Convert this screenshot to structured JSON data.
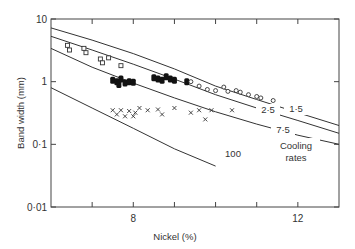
{
  "chart_data": {
    "type": "scatter",
    "title": "",
    "xlabel": "Nickel (%)",
    "ylabel": "Band width (mm)",
    "xlim": [
      6,
      13
    ],
    "ylim": [
      0.01,
      10
    ],
    "yscale": "log",
    "x_ticks": [
      7,
      8,
      9,
      10,
      11,
      12
    ],
    "x_tick_labels": [
      "8",
      "12"
    ],
    "y_tick_labels": [
      "10",
      "1",
      "0·1",
      "0·01"
    ],
    "grid": false,
    "legend": null,
    "annotations": [
      "1·5",
      "2·5",
      "7·5",
      "100",
      "Cooling",
      "rates"
    ],
    "curves": [
      {
        "name": "1·5",
        "points": [
          [
            6,
            7.2
          ],
          [
            7,
            4.6
          ],
          [
            8,
            2.8
          ],
          [
            9,
            1.6
          ],
          [
            10,
            0.85
          ],
          [
            11,
            0.52
          ],
          [
            12,
            0.32
          ],
          [
            13,
            0.2
          ]
        ]
      },
      {
        "name": "2·5",
        "points": [
          [
            6,
            5.3
          ],
          [
            7,
            3.2
          ],
          [
            8,
            1.9
          ],
          [
            9,
            1.1
          ],
          [
            10,
            0.62
          ],
          [
            11,
            0.38
          ],
          [
            12,
            0.24
          ],
          [
            13,
            0.15
          ]
        ]
      },
      {
        "name": "7·5",
        "points": [
          [
            6,
            3.4
          ],
          [
            7,
            1.7
          ],
          [
            8,
            0.95
          ],
          [
            9,
            0.55
          ],
          [
            10,
            0.33
          ],
          [
            11,
            0.21
          ],
          [
            12,
            0.14
          ],
          [
            13,
            0.1
          ]
        ]
      },
      {
        "name": "100",
        "points": [
          [
            6,
            0.8
          ],
          [
            7,
            0.38
          ],
          [
            8,
            0.18
          ],
          [
            9,
            0.085
          ],
          [
            10,
            0.045
          ]
        ]
      }
    ],
    "series": [
      {
        "name": "open squares",
        "marker": "square",
        "points": [
          [
            6.4,
            3.8
          ],
          [
            6.45,
            3.2
          ],
          [
            6.8,
            3.4
          ],
          [
            6.85,
            2.9
          ],
          [
            7.2,
            2.3
          ],
          [
            7.25,
            2.0
          ],
          [
            7.4,
            2.4
          ],
          [
            7.7,
            1.8
          ]
        ]
      },
      {
        "name": "filled",
        "marker": "filled",
        "points": [
          [
            7.5,
            1.05
          ],
          [
            7.6,
            1.0
          ],
          [
            7.7,
            1.1
          ],
          [
            7.8,
            0.95
          ],
          [
            7.9,
            1.0
          ],
          [
            8.0,
            0.98
          ],
          [
            7.65,
            0.9
          ],
          [
            8.5,
            1.15
          ],
          [
            8.6,
            1.1
          ],
          [
            8.7,
            1.05
          ],
          [
            8.8,
            1.2
          ],
          [
            8.9,
            1.1
          ],
          [
            9.0,
            1.05
          ],
          [
            9.3,
            1.0
          ]
        ]
      },
      {
        "name": "open circles",
        "marker": "circle",
        "points": [
          [
            9.4,
            1.0
          ],
          [
            9.6,
            0.85
          ],
          [
            9.8,
            0.75
          ],
          [
            10.0,
            0.72
          ],
          [
            10.2,
            0.82
          ],
          [
            10.3,
            0.7
          ],
          [
            10.5,
            0.72
          ],
          [
            10.6,
            0.68
          ],
          [
            10.8,
            0.62
          ],
          [
            11.0,
            0.58
          ],
          [
            11.1,
            0.55
          ],
          [
            11.4,
            0.5
          ]
        ]
      },
      {
        "name": "crosses",
        "marker": "x",
        "points": [
          [
            7.5,
            0.35
          ],
          [
            7.6,
            0.3
          ],
          [
            7.7,
            0.35
          ],
          [
            7.8,
            0.28
          ],
          [
            7.9,
            0.34
          ],
          [
            8.0,
            0.28
          ],
          [
            8.05,
            0.32
          ],
          [
            8.15,
            0.38
          ],
          [
            8.35,
            0.35
          ],
          [
            8.6,
            0.36
          ],
          [
            8.7,
            0.3
          ],
          [
            9.0,
            0.38
          ],
          [
            9.4,
            0.32
          ],
          [
            9.6,
            0.35
          ],
          [
            9.75,
            0.25
          ],
          [
            9.9,
            0.35
          ],
          [
            10.4,
            0.35
          ]
        ]
      }
    ]
  }
}
